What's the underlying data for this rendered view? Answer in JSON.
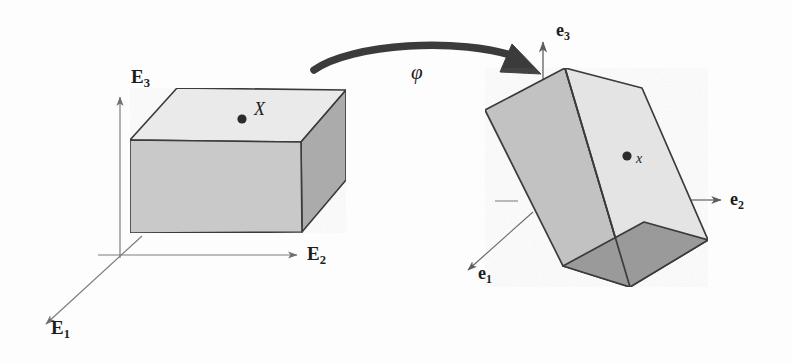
{
  "figure": {
    "background_color": "#fdfdfd",
    "ink_color": "#1c1c1c",
    "axis_color": "#7a7a7a"
  },
  "reference_configuration": {
    "name": "reference-body",
    "face_colors": {
      "top": "#eaeaea",
      "front": "#c9c9c9",
      "side": "#ababab"
    },
    "axes": [
      {
        "id": "E1",
        "letter": "E",
        "index": "1",
        "direction": "down-left"
      },
      {
        "id": "E2",
        "letter": "E",
        "index": "2",
        "direction": "right"
      },
      {
        "id": "E3",
        "letter": "E",
        "index": "3",
        "direction": "up"
      }
    ],
    "material_point": {
      "label": "X",
      "style": "italic",
      "description": "material point in reference configuration"
    }
  },
  "deformation_map": {
    "symbol": "φ",
    "arrow": "curved-thick-arrow-right",
    "description": "maps reference configuration onto current configuration"
  },
  "current_configuration": {
    "name": "deformed-body",
    "face_colors": {
      "front_light": "#e4e4e4",
      "left": "#c2c2c2",
      "bottom": "#9a9a9a"
    },
    "axes": [
      {
        "id": "e1",
        "letter": "e",
        "index": "1",
        "direction": "down-left"
      },
      {
        "id": "e2",
        "letter": "e",
        "index": "2",
        "direction": "right"
      },
      {
        "id": "e3",
        "letter": "e",
        "index": "3",
        "direction": "up"
      }
    ],
    "spatial_point": {
      "label": "x",
      "style": "italic",
      "description": "spatial point in current configuration"
    }
  }
}
